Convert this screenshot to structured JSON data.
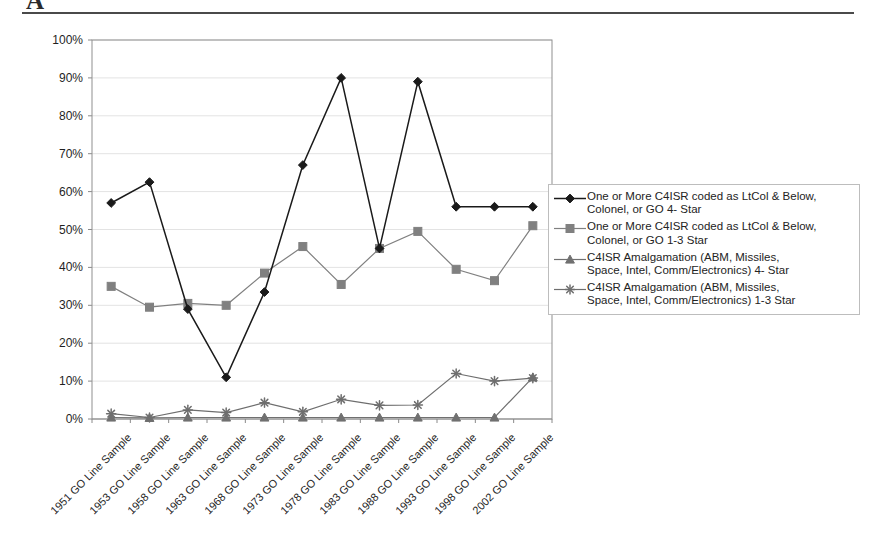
{
  "page": {
    "clipped_heading": "A",
    "background_color": "#ffffff"
  },
  "chart_data": {
    "type": "line",
    "title": "",
    "xlabel": "",
    "ylabel": "",
    "ylim": [
      0,
      100
    ],
    "ytick_labels": [
      "0%",
      "10%",
      "20%",
      "30%",
      "40%",
      "50%",
      "60%",
      "70%",
      "80%",
      "90%",
      "100%"
    ],
    "ytick_values": [
      0,
      10,
      20,
      30,
      40,
      50,
      60,
      70,
      80,
      90,
      100
    ],
    "grid": true,
    "legend_position": "right",
    "categories": [
      "1951 GO Line Sample",
      "1953 GO Line Sample",
      "1958 GO Line Sample",
      "1963 GO Line Sample",
      "1968 GO Line Sample",
      "1973 GO Line Sample",
      "1978 GO Line Sample",
      "1983 GO Line Sample",
      "1988 GO Line Sample",
      "1993 GO Line Sample",
      "1998 GO Line Sample",
      "2002 GO Line Sample"
    ],
    "series": [
      {
        "name": "One or More C4ISR coded as LtCol & Below,\nColonel, or GO 4- Star",
        "marker": "diamond",
        "color": "#1a1a1a",
        "values": [
          57,
          62.5,
          29,
          11,
          33.5,
          67,
          90,
          45,
          89,
          56,
          56,
          56
        ]
      },
      {
        "name": "One or More C4ISR coded as LtCol & Below,\nColonel, or GO 1-3 Star",
        "marker": "square",
        "color": "#808080",
        "values": [
          35,
          29.5,
          30.5,
          30,
          38.5,
          45.5,
          35.5,
          45,
          49.5,
          39.5,
          36.5,
          51
        ]
      },
      {
        "name": "C4ISR Amalgamation (ABM, Missiles,\nSpace, Intel, Comm/Electronics) 4- Star",
        "marker": "triangle",
        "color": "#707070",
        "values": [
          0.4,
          0.3,
          0.4,
          0.4,
          0.4,
          0.4,
          0.4,
          0.4,
          0.4,
          0.4,
          0.4,
          11
        ]
      },
      {
        "name": "C4ISR Amalgamation (ABM, Missiles,\nSpace, Intel, Comm/Electronics) 1-3 Star",
        "marker": "star",
        "color": "#6e6e6e",
        "values": [
          1.4,
          0.4,
          2.4,
          1.7,
          4.3,
          1.9,
          5.2,
          3.6,
          3.7,
          12,
          10,
          10.8
        ]
      }
    ]
  }
}
